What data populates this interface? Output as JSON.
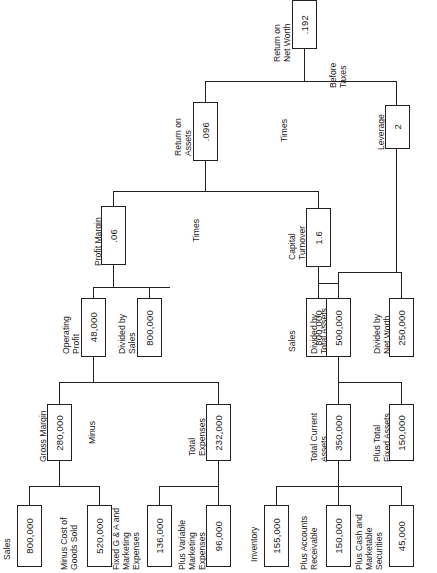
{
  "diagram": {
    "type": "financial-dupont-tree",
    "line_color": "#231f20",
    "box_fill": "#ffffff"
  },
  "nodes": {
    "return_on_net_worth": {
      "label": "Return on\nNet Worth",
      "value": ".192"
    },
    "return_on_assets": {
      "label": "Return on\nAssets",
      "value": ".096"
    },
    "leverage": {
      "label": "Leverage",
      "value": "2"
    },
    "profit_margin": {
      "label": "Profit Margin",
      "value": ".06"
    },
    "capital_turnover": {
      "label": "Capital\nTurnover",
      "value": "1.6"
    },
    "operating_profit": {
      "label": "Operating\nProfit",
      "value": "48,000"
    },
    "sales_pm": {
      "label": "Divided by\nSales",
      "value": "800,000"
    },
    "sales_ct": {
      "label": "Sales",
      "value": "800,000"
    },
    "total_assets": {
      "label": "Divided by\nTotal Assets",
      "value": "500,000"
    },
    "net_worth": {
      "label": "Divided by\nNet Worth",
      "value": "250,000"
    },
    "gross_margin": {
      "label": "Gross Margin",
      "value": "280,000"
    },
    "total_expenses": {
      "label": "Total\nExpenses",
      "value": "232,000"
    },
    "sales_gm": {
      "label": "Sales",
      "value": "800,000"
    },
    "cost_of_goods_sold": {
      "label": "Minus Cost of\nGoods Sold",
      "value": "520,000"
    },
    "fixed_ga_marketing": {
      "label": "Fixed G & A and\nMarketing\nExpenses",
      "value": "136,000"
    },
    "variable_marketing": {
      "label": "Plus Variable\nMarketing\nExpenses",
      "value": "96,000"
    },
    "total_current_assets": {
      "label": "Total Current\nAssets",
      "value": "350,000"
    },
    "total_fixed_assets": {
      "label": "Plus Total\nFixed Assets",
      "value": "150,000"
    },
    "inventory": {
      "label": "Inventory",
      "value": "155,000"
    },
    "accounts_receivable": {
      "label": "Plus Accounts\nReceivable",
      "value": "150,000"
    },
    "cash_securities": {
      "label": "Plus Cash and\nMarketable\nSecurities",
      "value": "45,000"
    }
  },
  "operators": {
    "before_taxes": "Before\nTaxes",
    "times_top": "Times",
    "times_mid": "Times",
    "minus": "Minus"
  }
}
